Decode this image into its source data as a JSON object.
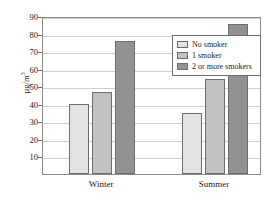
{
  "chart_data": {
    "type": "bar",
    "title": "",
    "xlabel": "",
    "ylabel": "µg/m",
    "ylabel_exponent": "3",
    "categories": [
      "Winter",
      "Summer"
    ],
    "series": [
      {
        "name": "No smoker",
        "values": [
          40,
          34.5
        ],
        "color": "#e3e3e3"
      },
      {
        "name": "1 smoker",
        "values": [
          47,
          54
        ],
        "color": "#c2c2c2"
      },
      {
        "name": "2 or more smokers",
        "values": [
          76,
          85.5
        ],
        "color": "#929292"
      }
    ],
    "ylim": [
      0,
      90
    ],
    "yticks": [
      10,
      20,
      30,
      40,
      50,
      60,
      70,
      80,
      90
    ],
    "ytick_labels": [
      "10",
      "20",
      "30",
      "40",
      "50",
      "60",
      "70",
      "80",
      "90"
    ],
    "grid": true,
    "legend_position": "top-right-inside",
    "frame_color": "#8a8a8a",
    "grid_color": "#cfcfcf",
    "bar_edge_color": "#6d6d6d",
    "background": "#ffffff"
  }
}
